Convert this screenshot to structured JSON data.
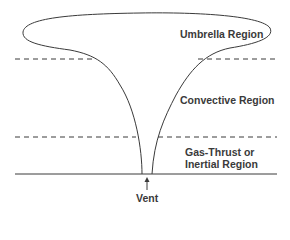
{
  "diagram": {
    "regions": [
      {
        "id": "umbrella",
        "label": "Umbrella Region"
      },
      {
        "id": "convective",
        "label": "Convective Region"
      },
      {
        "id": "gas-thrust",
        "label_line1": "Gas-Thrust or",
        "label_line2": "Inertial Region"
      }
    ],
    "vent_label": "Vent",
    "colors": {
      "line": "#3a3a3a",
      "text": "#3a3a3a",
      "background": "#ffffff"
    }
  }
}
